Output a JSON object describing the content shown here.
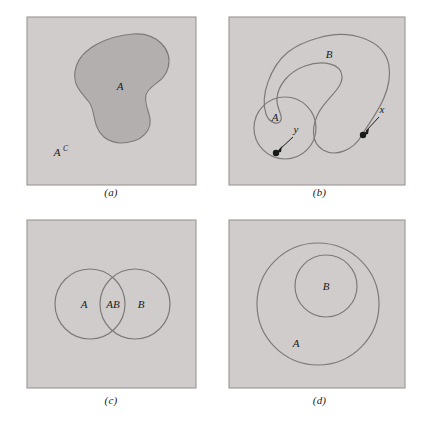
{
  "figure": {
    "type": "venn-diagram-set",
    "background": "#ffffff",
    "box_fill": "#cfcccb",
    "box_stroke": "#9a9694",
    "region_fill_dark": "#b3afae",
    "shape_stroke": "#7d7a78",
    "text_color": "#1a1a1a"
  },
  "panels": [
    {
      "id": "a",
      "caption": "(a)",
      "labels": [
        {
          "name": "set-a",
          "text": "A",
          "sup": ""
        },
        {
          "name": "set-a-complement",
          "text": "A",
          "sup": "C"
        }
      ],
      "description": "Square sample space with a shaded blob region A and its complement A superscript C"
    },
    {
      "id": "b",
      "caption": "(b)",
      "labels": [
        {
          "name": "set-b",
          "text": "B",
          "sup": ""
        },
        {
          "name": "set-a",
          "text": "A",
          "sup": ""
        },
        {
          "name": "point-x",
          "text": "x",
          "sup": ""
        },
        {
          "name": "point-y",
          "text": "y",
          "sup": ""
        }
      ],
      "description": "Square sample space with a small circle A containing point y and a large curved blob B containing point x"
    },
    {
      "id": "c",
      "caption": "(c)",
      "labels": [
        {
          "name": "set-a",
          "text": "A",
          "sup": ""
        },
        {
          "name": "set-ab-intersection",
          "text": "AB",
          "sup": ""
        },
        {
          "name": "set-b",
          "text": "B",
          "sup": ""
        }
      ],
      "description": "Square sample space with two overlapping circles A and B whose intersection is labelled AB"
    },
    {
      "id": "d",
      "caption": "(d)",
      "labels": [
        {
          "name": "set-b",
          "text": "B",
          "sup": ""
        },
        {
          "name": "set-a",
          "text": "A",
          "sup": ""
        }
      ],
      "description": "Square sample space with circle B nested entirely inside larger circle A"
    }
  ]
}
